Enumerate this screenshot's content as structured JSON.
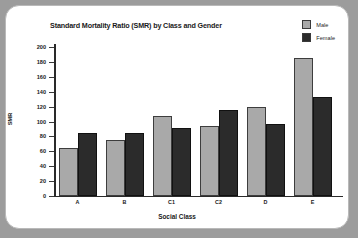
{
  "chart_data": {
    "type": "bar",
    "title": "Standard Mortality Ratio (SMR) by Class and Gender",
    "xlabel": "Social Class",
    "ylabel": "SMR",
    "categories": [
      "A",
      "B",
      "C1",
      "C2",
      "D",
      "E"
    ],
    "series": [
      {
        "name": "Male",
        "color": "#a9a9a9",
        "values": [
          64,
          75,
          107,
          94,
          119,
          185
        ]
      },
      {
        "name": "Female",
        "color": "#2b2b2b",
        "values": [
          84,
          85,
          91,
          115,
          96,
          133
        ]
      }
    ],
    "ylim": [
      0,
      200
    ],
    "yticks": [
      0,
      20,
      40,
      60,
      80,
      100,
      120,
      140,
      160,
      180,
      200
    ],
    "ytick_labels": [
      "0",
      "20",
      "40",
      "60",
      "80",
      "100",
      "120",
      "140",
      "160",
      "180",
      "200"
    ],
    "grid": false,
    "legend_position": "top-right"
  },
  "legend": {
    "entries": [
      {
        "label": "Male",
        "swatch": "male-swatch"
      },
      {
        "label": "Female",
        "swatch": "female-swatch"
      }
    ]
  }
}
